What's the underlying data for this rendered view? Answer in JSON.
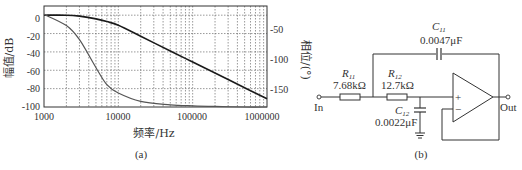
{
  "figure_a": {
    "caption": "(a)",
    "xlabel": "频率/Hz",
    "ylabel_left": "幅值/dB",
    "ylabel_right": "相位/(°)",
    "x_ticks": [
      "1000",
      "10000",
      "100000",
      "1000000"
    ],
    "y_left_ticks": [
      "0",
      "-20",
      "-40",
      "-60",
      "-80",
      "-100"
    ],
    "y_right_ticks": [
      "-50",
      "-100",
      "-150"
    ]
  },
  "figure_b": {
    "caption": "(b)",
    "input_label": "In",
    "output_label": "Out",
    "r11": {
      "name": "R",
      "sub": "11",
      "value": "7.68kΩ"
    },
    "r12": {
      "name": "R",
      "sub": "12",
      "value": "12.7kΩ"
    },
    "c11": {
      "name": "C",
      "sub": "11",
      "value": "0.0047μF"
    },
    "c12": {
      "name": "C",
      "sub": "12",
      "value": "0.0022μF"
    },
    "opamp_plus": "+",
    "opamp_minus": "−"
  },
  "chart_data": {
    "type": "line",
    "title": "",
    "xlabel": "频率/Hz",
    "ylabel": "幅值/dB",
    "ylabel_right": "相位/(°)",
    "xscale": "log",
    "xlim": [
      1000,
      1000000
    ],
    "ylim": [
      -100,
      10
    ],
    "ylim_right": [
      -180,
      0
    ],
    "grid": true,
    "x": [
      1000,
      2000,
      3000,
      5000,
      7000,
      10000,
      20000,
      50000,
      100000,
      200000,
      500000,
      1000000
    ],
    "series": [
      {
        "name": "幅值 (magnitude, dB)",
        "axis": "left",
        "values": [
          0,
          0,
          -1,
          -4,
          -7,
          -11,
          -23,
          -39,
          -51,
          -63,
          -79,
          -91
        ]
      },
      {
        "name": "相位 (phase, °)",
        "axis": "right",
        "values": [
          -15,
          -35,
          -60,
          -110,
          -140,
          -155,
          -170,
          -176,
          -178,
          -179,
          -180,
          -180
        ]
      }
    ]
  }
}
